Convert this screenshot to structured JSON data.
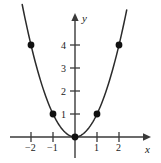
{
  "chart_data": {
    "type": "line",
    "title": "",
    "subtitle": "",
    "function": "y = x^2",
    "xlabel": "x",
    "ylabel": "y",
    "xlim": [
      -2.9,
      3.4
    ],
    "ylim": [
      -0.9,
      5.3
    ],
    "xticks": [
      -2,
      -1,
      1,
      2
    ],
    "yticks": [
      1,
      2,
      3,
      4
    ],
    "xtick_labels": [
      "−2",
      "−1",
      "1",
      "2"
    ],
    "ytick_labels": [
      "1",
      "2",
      "3",
      "4"
    ],
    "grid": false,
    "legend": null,
    "annotations": [],
    "series": [
      {
        "name": "y = x^2",
        "type": "curve",
        "color": "#2b2b2b",
        "x": [
          -2.35,
          -2.0,
          -1.5,
          -1.0,
          -0.5,
          0.0,
          0.5,
          1.0,
          1.5,
          2.0,
          2.35
        ],
        "y": [
          5.52,
          4.0,
          2.25,
          1.0,
          0.25,
          0.0,
          0.25,
          1.0,
          2.25,
          4.0,
          5.52
        ]
      },
      {
        "name": "plotted points",
        "type": "scatter",
        "color": "#111111",
        "points": [
          {
            "x": -2,
            "y": 4,
            "label": "(−2, 4)"
          },
          {
            "x": -1,
            "y": 1,
            "label": "(−1, 1)"
          },
          {
            "x": 0,
            "y": 0,
            "label": "(0, 0)"
          },
          {
            "x": 1,
            "y": 1,
            "label": "(1, 1)"
          },
          {
            "x": 2,
            "y": 4,
            "label": "(2, 4)"
          }
        ]
      }
    ]
  },
  "axes": {
    "x_axis_label": "x",
    "y_axis_label": "y",
    "axis_color": "#3a3a3a"
  },
  "labels": {
    "x_neg2": "−2",
    "x_neg1": "−1",
    "x_pos1": "1",
    "x_pos2": "2",
    "y_1": "1",
    "y_2": "2",
    "y_3": "3",
    "y_4": "4"
  }
}
